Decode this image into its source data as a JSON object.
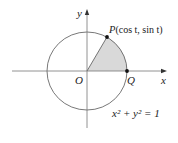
{
  "diagram": {
    "colors": {
      "line": "#555555",
      "sector_fill": "#d9d9d9",
      "text": "#222222"
    },
    "labels": {
      "y_axis": "y",
      "x_axis": "x",
      "origin": "O",
      "point_q": "Q",
      "point_p": "P",
      "point_p_coords": "(cos t, sin t)",
      "equation": "x² + y² = 1"
    }
  }
}
